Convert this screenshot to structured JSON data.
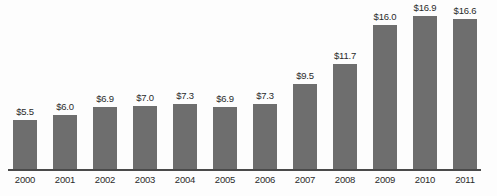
{
  "chart_data": {
    "type": "bar",
    "title": "",
    "subtitle": "",
    "xlabel": "",
    "ylabel": "",
    "categories": [
      "2000",
      "2001",
      "2002",
      "2003",
      "2004",
      "2005",
      "2006",
      "2007",
      "2008",
      "2009",
      "2010",
      "2011"
    ],
    "values": [
      5.5,
      6.0,
      6.9,
      7.0,
      7.3,
      6.9,
      7.3,
      9.5,
      11.7,
      16.0,
      16.9,
      16.6
    ],
    "value_labels": [
      "$5.5",
      "$6.0",
      "$6.9",
      "$7.0",
      "$7.3",
      "$6.9",
      "$7.3",
      "$9.5",
      "$11.7",
      "$16.0",
      "$16.9",
      "$16.6"
    ],
    "ylim": [
      0,
      18.6
    ],
    "grid": false,
    "legend": "none",
    "y_axis_visible": false,
    "x_axis_visible": true,
    "bar_color": "#6e6e6e",
    "axis_color": "#4a4a4a",
    "text_color": "#2b2b2b",
    "background_color": "#fdfdfd"
  }
}
